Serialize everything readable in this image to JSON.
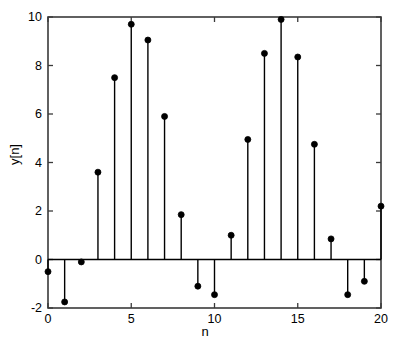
{
  "chart_data": {
    "type": "stem",
    "title": "",
    "xlabel": "n",
    "ylabel": "y[n]",
    "x": [
      0,
      1,
      2,
      3,
      4,
      5,
      6,
      7,
      8,
      9,
      10,
      11,
      12,
      13,
      14,
      15,
      16,
      17,
      18,
      19,
      20
    ],
    "values": [
      -0.5,
      -1.75,
      -0.1,
      3.6,
      7.5,
      9.7,
      9.05,
      5.9,
      1.85,
      -1.1,
      -1.45,
      1.0,
      4.95,
      8.5,
      9.9,
      8.35,
      4.75,
      0.85,
      -1.45,
      -0.9,
      2.2
    ],
    "xlim": [
      0,
      20
    ],
    "ylim": [
      -2,
      10
    ],
    "xticks": [
      0,
      5,
      10,
      15,
      20
    ],
    "yticks": [
      -2,
      0,
      2,
      4,
      6,
      8,
      10
    ],
    "xtick_labels": [
      "0",
      "5",
      "10",
      "15",
      "20"
    ],
    "ytick_labels": [
      "-2",
      "0",
      "2",
      "4",
      "6",
      "8",
      "10"
    ],
    "grid": false,
    "legend": null,
    "baseline": 0,
    "marker": "filled-circle",
    "marker_color": "#000000",
    "stem_color": "#000000",
    "axis_color": "#3a3a3a"
  }
}
